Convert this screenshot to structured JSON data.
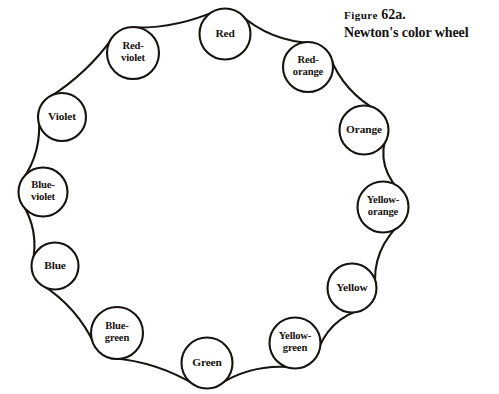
{
  "figure": {
    "label_prefix": "Figure",
    "number": "62a.",
    "title": "Newton's color wheel"
  },
  "wheel": {
    "center_x": 207,
    "center_y": 198,
    "ring_radius": 165,
    "stroke_color": "#17130f",
    "background_color": "#ffffff",
    "node_count": 12,
    "nodes": [
      {
        "name": "red",
        "label": "Red",
        "lines": [
          "Red"
        ],
        "cx": 225,
        "cy": 34,
        "r": 25.5
      },
      {
        "name": "red-orange",
        "label": "Red-orange",
        "lines": [
          "Red-",
          "orange"
        ],
        "cx": 308,
        "cy": 67,
        "r": 25.0
      },
      {
        "name": "orange",
        "label": "Orange",
        "lines": [
          "Orange"
        ],
        "cx": 364,
        "cy": 130,
        "r": 24.5
      },
      {
        "name": "yellow-orange",
        "label": "Yellow-orange",
        "lines": [
          "Yellow-",
          "orange"
        ],
        "cx": 383,
        "cy": 207,
        "r": 25.5
      },
      {
        "name": "yellow",
        "label": "Yellow",
        "lines": [
          "Yellow"
        ],
        "cx": 352,
        "cy": 288,
        "r": 24.5
      },
      {
        "name": "yellow-green",
        "label": "Yellow-green",
        "lines": [
          "Yellow-",
          "green"
        ],
        "cx": 295,
        "cy": 343,
        "r": 25.5
      },
      {
        "name": "green",
        "label": "Green",
        "lines": [
          "Green"
        ],
        "cx": 207,
        "cy": 363,
        "r": 25.5
      },
      {
        "name": "blue-green",
        "label": "Blue-green",
        "lines": [
          "Blue-",
          "green"
        ],
        "cx": 117,
        "cy": 333,
        "r": 26.0
      },
      {
        "name": "blue",
        "label": "Blue",
        "lines": [
          "Blue"
        ],
        "cx": 55,
        "cy": 266,
        "r": 23.5
      },
      {
        "name": "blue-violet",
        "label": "Blue-violet",
        "lines": [
          "Blue-",
          "violet"
        ],
        "cx": 43,
        "cy": 192,
        "r": 24.5
      },
      {
        "name": "violet",
        "label": "Violet",
        "lines": [
          "Violet"
        ],
        "cx": 62,
        "cy": 117,
        "r": 24.0
      },
      {
        "name": "red-violet",
        "label": "Red-violet",
        "lines": [
          "Red-",
          "violet"
        ],
        "cx": 133,
        "cy": 53,
        "r": 26.0
      }
    ]
  }
}
